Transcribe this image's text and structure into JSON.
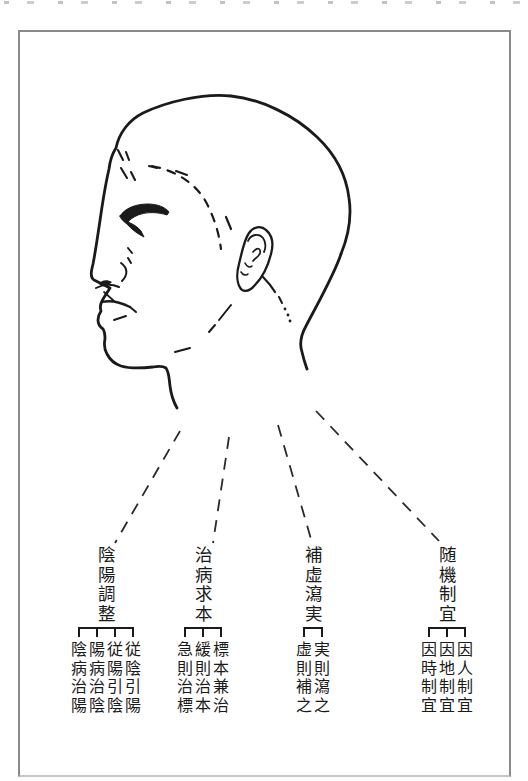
{
  "figure": {
    "colors": {
      "ink": "#1a1a1a",
      "frame": "#8a8a8a"
    },
    "groups": [
      {
        "header": "陰陽調整",
        "items": [
          "陰病治陽",
          "陽病治陰",
          "従陽引陰",
          "従陰引陽"
        ]
      },
      {
        "header": "治病求本",
        "items": [
          "急則治標",
          "緩則治本",
          "標本兼治"
        ]
      },
      {
        "header": "補虚瀉実",
        "items": [
          "虚則補之",
          "実則瀉之"
        ]
      },
      {
        "header": "随機制宜",
        "items": [
          "因時制宜",
          "因地制宜",
          "因人制宜"
        ]
      }
    ]
  }
}
